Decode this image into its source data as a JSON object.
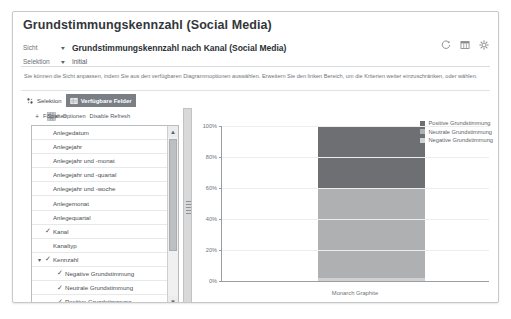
{
  "header": {
    "title": "Grundstimmungskennzahl (Social Media)",
    "view_label": "Sicht",
    "view_value": "Grundstimmungskennzahl nach Kanal (Social Media)",
    "selection_label": "Selektion",
    "selection_value": "Initial",
    "icons": {
      "refresh": "refresh-icon",
      "table": "table-view-icon",
      "settings": "gear-icon"
    }
  },
  "description": "Sie können die Sicht anpassen, indem Sie aus den verfügbaren Diagrammoptionen auswählen. Erweitern Sie den linken Bereich, um die Kriterien weiter einzuschränken, oder wählen.",
  "tabs": [
    {
      "label": "Selektion",
      "icon": "selection-icon",
      "active": false
    },
    {
      "label": "Verfügbare Felder",
      "icon": "fields-icon",
      "active": true
    }
  ],
  "strip": {
    "add": "+",
    "field_link": "Felder",
    "columns_link": "Spalten",
    "options_link": "Optionen",
    "refresh_link": "Disable Refresh"
  },
  "field_list": [
    {
      "label": "Anlegedatum",
      "checked": false,
      "indent": 0,
      "expandable": false
    },
    {
      "label": "Anlegejahr",
      "checked": false,
      "indent": 0,
      "expandable": false
    },
    {
      "label": "Anlegejahr und -monat",
      "checked": false,
      "indent": 0,
      "expandable": false
    },
    {
      "label": "Anlegejahr und -quartal",
      "checked": false,
      "indent": 0,
      "expandable": false
    },
    {
      "label": "Anlegejahr und -woche",
      "checked": false,
      "indent": 0,
      "expandable": false
    },
    {
      "label": "Anlegemonat",
      "checked": false,
      "indent": 0,
      "expandable": false
    },
    {
      "label": "Anlegequartal",
      "checked": false,
      "indent": 0,
      "expandable": false
    },
    {
      "label": "Kanal",
      "checked": true,
      "indent": 0,
      "expandable": false
    },
    {
      "label": "Kanaltyp",
      "checked": false,
      "indent": 0,
      "expandable": false
    },
    {
      "label": "Kennzahl",
      "checked": true,
      "indent": 0,
      "expandable": true
    },
    {
      "label": "Negative Grundstimmung",
      "checked": true,
      "indent": 1,
      "expandable": false
    },
    {
      "label": "Neutrale Grundstimmung",
      "checked": true,
      "indent": 1,
      "expandable": false
    },
    {
      "label": "Positive Grundstimmung",
      "checked": true,
      "indent": 1,
      "expandable": false
    },
    {
      "label": "Kunde",
      "checked": false,
      "indent": 0,
      "expandable": false
    },
    {
      "label": "Sprache",
      "checked": false,
      "indent": 0,
      "expandable": false
    },
    {
      "label": "Ticket - Produktkategoriebeschreibung",
      "checked": false,
      "indent": 0,
      "expandable": false
    }
  ],
  "chart_data": {
    "type": "bar",
    "stacked": true,
    "percent": true,
    "title": "",
    "xlabel": "",
    "ylabel": "",
    "categories": [
      "Monarch Graphite"
    ],
    "ylim": [
      0,
      100
    ],
    "yticks": [
      0,
      20,
      40,
      60,
      80,
      100
    ],
    "ytick_labels": [
      "0%",
      "20%",
      "40%",
      "60%",
      "80%",
      "100%"
    ],
    "grid": true,
    "legend_position": "top-right",
    "series": [
      {
        "name": "Positive Grundstimmung",
        "values": [
          40
        ],
        "color": "#6d6f72"
      },
      {
        "name": "Neutrale Grundstimmung",
        "values": [
          58
        ],
        "color": "#aeb0b2"
      },
      {
        "name": "Negative Grundstimmung",
        "values": [
          2
        ],
        "color": "#cfd1d2"
      }
    ]
  }
}
